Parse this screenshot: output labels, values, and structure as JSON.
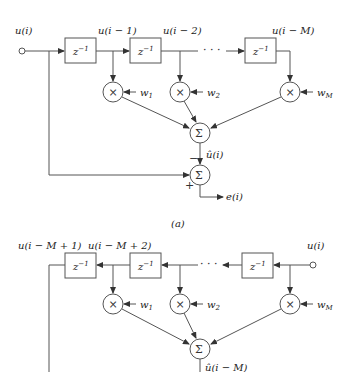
{
  "diagram_a": {
    "input_label": "u(i)",
    "tap_labels": [
      "u(i − 1)",
      "u(i − 2)",
      "u(i − M)"
    ],
    "delay_label": "z",
    "delay_exp": "−1",
    "weights": [
      "w",
      "w",
      "w"
    ],
    "weight_subs": [
      "1",
      "2",
      "M"
    ],
    "multiplier_symbol": "×",
    "sum_symbol": "Σ",
    "estimate_label": "û(i)",
    "minus_sign": "−",
    "plus_sign": "+",
    "output_label": "e(i)",
    "ellipsis": "· · ·",
    "caption": "(a)"
  },
  "diagram_b": {
    "input_label": "u(i)",
    "tap_labels": [
      "u(i − M + 1)",
      "u(i − M + 2)"
    ],
    "delay_label": "z",
    "delay_exp": "−1",
    "weights": [
      "w",
      "w",
      "w"
    ],
    "weight_subs": [
      "1",
      "2",
      "M"
    ],
    "multiplier_symbol": "×",
    "sum_symbol": "Σ",
    "estimate_label": "û(i − M)",
    "ellipsis": "· · ·"
  }
}
